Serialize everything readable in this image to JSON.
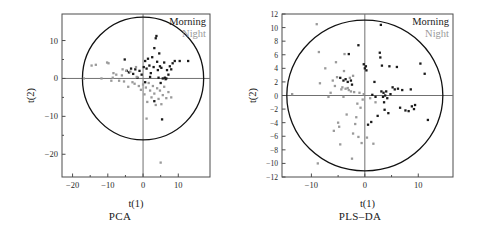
{
  "figure": {
    "panels": [
      {
        "caption": "PCA",
        "xlabel": "t(1)",
        "ylabel": "t(2)",
        "legend": [
          {
            "label": "Morning",
            "color": "#1a1a1a"
          },
          {
            "label": "Night",
            "color": "#9a9a9a"
          }
        ],
        "chart_data": {
          "type": "scatter",
          "title": "PCA",
          "xlabel": "t(1)",
          "ylabel": "t(2)",
          "xlim": [
            -23,
            19
          ],
          "ylim": [
            -26,
            17
          ],
          "xticks": [
            -20,
            -10,
            0,
            10
          ],
          "yticks": [
            10,
            0,
            -10,
            -20
          ],
          "grid": false,
          "legend_position": "top-right",
          "annotations": [
            "Hotelling T2 95% confidence ellipse"
          ],
          "ellipse": {
            "cx": 0,
            "cy": 0,
            "rx": 17.2,
            "ry": 16.2
          },
          "series": [
            {
              "name": "Morning",
              "color": "#1a1a1a",
              "marker": "square",
              "points": [
                [
                  -5.2,
                  5.0
                ],
                [
                  -4.6,
                  2.0
                ],
                [
                  -4.0,
                  1.6
                ],
                [
                  -3.4,
                  2.6
                ],
                [
                  -2.8,
                  1.2
                ],
                [
                  -2.2,
                  2.4
                ],
                [
                  -1.6,
                  0.2
                ],
                [
                  -1.0,
                  2.0
                ],
                [
                  0.2,
                  3.0
                ],
                [
                  0.6,
                  4.6
                ],
                [
                  1.0,
                  2.6
                ],
                [
                  1.4,
                  5.2
                ],
                [
                  1.8,
                  3.4
                ],
                [
                  2.2,
                  1.4
                ],
                [
                  2.6,
                  5.6
                ],
                [
                  3.0,
                  3.0
                ],
                [
                  3.2,
                  8.0
                ],
                [
                  3.6,
                  10.6
                ],
                [
                  3.8,
                  11.2
                ],
                [
                  4.0,
                  4.4
                ],
                [
                  4.2,
                  2.2
                ],
                [
                  4.4,
                  0.2
                ],
                [
                  4.6,
                  6.6
                ],
                [
                  4.8,
                  3.2
                ],
                [
                  5.0,
                  -1.2
                ],
                [
                  5.2,
                  2.8
                ],
                [
                  5.6,
                  0.0
                ],
                [
                  6.0,
                  4.2
                ],
                [
                  6.2,
                  0.2
                ],
                [
                  6.4,
                  -0.2
                ],
                [
                  6.6,
                  0.0
                ],
                [
                  6.8,
                  2.2
                ],
                [
                  7.2,
                  1.0
                ],
                [
                  7.6,
                  3.2
                ],
                [
                  8.0,
                  2.4
                ],
                [
                  8.4,
                  4.0
                ],
                [
                  9.0,
                  4.6
                ],
                [
                  10.4,
                  4.6
                ],
                [
                  12.8,
                  4.6
                ],
                [
                  5.4,
                  -10.8
                ],
                [
                  3.2,
                  -6.0
                ],
                [
                  0.6,
                  -1.0
                ],
                [
                  -0.4,
                  1.0
                ],
                [
                  2.0,
                  0.4
                ]
              ]
            },
            {
              "name": "Night",
              "color": "#9a9a9a",
              "marker": "square",
              "points": [
                [
                  -16.8,
                  0.0
                ],
                [
                  -14.6,
                  3.4
                ],
                [
                  -13.4,
                  3.6
                ],
                [
                  -11.8,
                  0.0
                ],
                [
                  -9.8,
                  4.0
                ],
                [
                  -9.0,
                  -0.6
                ],
                [
                  -8.4,
                  1.4
                ],
                [
                  -7.6,
                  1.0
                ],
                [
                  -6.8,
                  -0.6
                ],
                [
                  -6.0,
                  0.8
                ],
                [
                  -5.4,
                  -0.8
                ],
                [
                  -4.8,
                  2.0
                ],
                [
                  -4.2,
                  -2.2
                ],
                [
                  -3.6,
                  1.8
                ],
                [
                  -3.0,
                  -1.0
                ],
                [
                  -2.4,
                  -1.4
                ],
                [
                  -1.8,
                  0.4
                ],
                [
                  -1.2,
                  -2.0
                ],
                [
                  -0.6,
                  -3.0
                ],
                [
                  0.0,
                  -1.6
                ],
                [
                  0.4,
                  -4.2
                ],
                [
                  0.8,
                  -2.4
                ],
                [
                  1.2,
                  -6.2
                ],
                [
                  1.6,
                  -1.2
                ],
                [
                  2.0,
                  -3.2
                ],
                [
                  2.4,
                  -5.0
                ],
                [
                  2.8,
                  -2.0
                ],
                [
                  3.2,
                  -4.0
                ],
                [
                  3.6,
                  -7.0
                ],
                [
                  4.0,
                  -2.6
                ],
                [
                  4.4,
                  -5.4
                ],
                [
                  4.8,
                  -3.2
                ],
                [
                  5.2,
                  -6.8
                ],
                [
                  5.6,
                  -4.4
                ],
                [
                  6.0,
                  -2.2
                ],
                [
                  6.6,
                  -5.2
                ],
                [
                  7.2,
                  -3.6
                ],
                [
                  8.0,
                  -5.0
                ],
                [
                  1.0,
                  -10.6
                ],
                [
                  5.0,
                  -22.2
                ],
                [
                  -8.6,
                  0.2
                ],
                [
                  -2.0,
                  3.0
                ],
                [
                  -5.8,
                  2.4
                ],
                [
                  -10.2,
                  4.2
                ]
              ]
            }
          ]
        }
      },
      {
        "caption": "PLS–DA",
        "xlabel": "t(1)",
        "ylabel": "t(2)",
        "legend": [
          {
            "label": "Morning",
            "color": "#1a1a1a"
          },
          {
            "label": "Night",
            "color": "#9a9a9a"
          }
        ],
        "chart_data": {
          "type": "scatter",
          "title": "PLS-DA",
          "xlabel": "t(1)",
          "ylabel": "t(2)",
          "xlim": [
            -15.5,
            16.5
          ],
          "ylim": [
            -12,
            12
          ],
          "xticks": [
            -10,
            0,
            10
          ],
          "yticks": [
            12,
            10,
            8,
            6,
            4,
            2,
            0,
            -2,
            -4,
            -6,
            -8,
            -10,
            -12
          ],
          "grid": false,
          "legend_position": "top-right",
          "annotations": [
            "Hotelling T2 95% confidence ellipse"
          ],
          "ellipse": {
            "cx": 0,
            "cy": 0,
            "rx": 14.6,
            "ry": 11.1
          },
          "series": [
            {
              "name": "Morning",
              "color": "#1a1a1a",
              "marker": "square",
              "points": [
                [
                  -4.6,
                  2.6
                ],
                [
                  -4.0,
                  2.2
                ],
                [
                  -3.6,
                  2.4
                ],
                [
                  -3.2,
                  2.0
                ],
                [
                  -3.0,
                  6.1
                ],
                [
                  -2.6,
                  2.2
                ],
                [
                  -2.4,
                  1.6
                ],
                [
                  -1.2,
                  7.4
                ],
                [
                  -0.2,
                  4.6
                ],
                [
                  0.0,
                  4.0
                ],
                [
                  0.2,
                  4.3
                ],
                [
                  0.3,
                  3.7
                ],
                [
                  0.6,
                  -4.3
                ],
                [
                  1.2,
                  -3.9
                ],
                [
                  1.8,
                  2.0
                ],
                [
                  2.4,
                  -3.0
                ],
                [
                  2.8,
                  6.3
                ],
                [
                  2.9,
                  5.6
                ],
                [
                  3.0,
                  10.4
                ],
                [
                  3.1,
                  0.6
                ],
                [
                  3.2,
                  4.4
                ],
                [
                  3.4,
                  -0.2
                ],
                [
                  3.5,
                  0.4
                ],
                [
                  3.6,
                  -1.0
                ],
                [
                  3.7,
                  -2.1
                ],
                [
                  3.8,
                  0.0
                ],
                [
                  4.0,
                  0.6
                ],
                [
                  4.2,
                  -0.4
                ],
                [
                  4.4,
                  -2.6
                ],
                [
                  4.6,
                  4.3
                ],
                [
                  5.2,
                  1.2
                ],
                [
                  5.6,
                  0.9
                ],
                [
                  6.0,
                  4.2
                ],
                [
                  6.2,
                  1.0
                ],
                [
                  6.6,
                  -1.8
                ],
                [
                  7.0,
                  0.8
                ],
                [
                  7.6,
                  -2.2
                ],
                [
                  8.2,
                  -2.3
                ],
                [
                  8.6,
                  0.9
                ],
                [
                  8.8,
                  -1.6
                ],
                [
                  9.2,
                  -2.0
                ],
                [
                  9.4,
                  -1.4
                ],
                [
                  10.4,
                  4.7
                ],
                [
                  11.2,
                  3.2
                ],
                [
                  11.8,
                  -3.6
                ],
                [
                  2.0,
                  -0.2
                ],
                [
                  4.8,
                  0.2
                ],
                [
                  1.4,
                  0.1
                ]
              ]
            },
            {
              "name": "Night",
              "color": "#9a9a9a",
              "marker": "square",
              "points": [
                [
                  -13.6,
                  0.2
                ],
                [
                  -9.0,
                  10.5
                ],
                [
                  -8.6,
                  6.4
                ],
                [
                  -8.4,
                  1.8
                ],
                [
                  -7.4,
                  4.0
                ],
                [
                  -6.4,
                  0.4
                ],
                [
                  -6.0,
                  2.2
                ],
                [
                  -5.6,
                  1.4
                ],
                [
                  -5.4,
                  4.9
                ],
                [
                  -5.2,
                  2.7
                ],
                [
                  -5.0,
                  -4.0
                ],
                [
                  -4.8,
                  -4.6
                ],
                [
                  -4.6,
                  -7.2
                ],
                [
                  -4.4,
                  0.9
                ],
                [
                  -4.2,
                  1.2
                ],
                [
                  -4.0,
                  -0.2
                ],
                [
                  -3.8,
                  6.1
                ],
                [
                  -3.6,
                  1.0
                ],
                [
                  -3.4,
                  -2.8
                ],
                [
                  -3.2,
                  1.1
                ],
                [
                  -3.0,
                  0.8
                ],
                [
                  -2.8,
                  2.6
                ],
                [
                  -2.6,
                  0.6
                ],
                [
                  -2.4,
                  -9.3
                ],
                [
                  -2.2,
                  -5.6
                ],
                [
                  -2.0,
                  0.5
                ],
                [
                  -1.8,
                  -4.2
                ],
                [
                  -1.6,
                  -3.2
                ],
                [
                  -1.4,
                  -1.2
                ],
                [
                  -1.2,
                  -6.1
                ],
                [
                  -1.0,
                  0.4
                ],
                [
                  -0.8,
                  -1.8
                ],
                [
                  -0.6,
                  -7.0
                ],
                [
                  -0.4,
                  -0.6
                ],
                [
                  -0.2,
                  0.2
                ],
                [
                  0.4,
                  -6.2
                ],
                [
                  1.0,
                  -0.4
                ],
                [
                  1.6,
                  -7.1
                ],
                [
                  2.0,
                  -1.0
                ],
                [
                  -8.8,
                  -10.0
                ],
                [
                  -6.8,
                  -0.2
                ],
                [
                  -2.2,
                  2.9
                ],
                [
                  -5.8,
                  -5.2
                ],
                [
                  -3.9,
                  3.6
                ]
              ]
            }
          ]
        }
      }
    ]
  }
}
